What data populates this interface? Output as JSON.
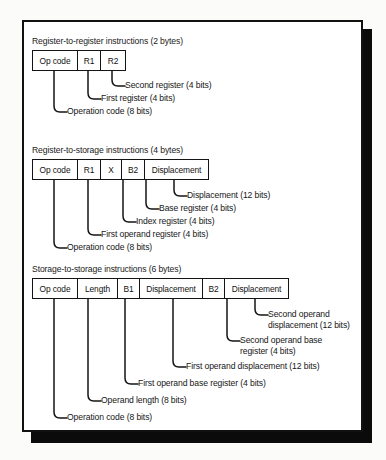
{
  "figure": {
    "background_color": "#fbfbfa",
    "frame_color": "#111111",
    "page_color": "#ffffff"
  },
  "diagrams": [
    {
      "id": "register-to-register",
      "title": "Register-to-register instructions (2 bytes)",
      "fields": [
        {
          "label": "Op code",
          "width_px": 45
        },
        {
          "label": "R1",
          "width_px": 23
        },
        {
          "label": "R2",
          "width_px": 24
        }
      ],
      "callouts": [
        {
          "label": "Second register (4 bits)"
        },
        {
          "label": "First register (4 bits)"
        },
        {
          "label": "Operation code (8 bits)"
        }
      ]
    },
    {
      "id": "register-to-storage",
      "title": "Register-to-storage instructions (4 bytes)",
      "fields": [
        {
          "label": "Op code",
          "width_px": 45
        },
        {
          "label": "R1",
          "width_px": 23
        },
        {
          "label": "X",
          "width_px": 21
        },
        {
          "label": "B2",
          "width_px": 23
        },
        {
          "label": "Displacement",
          "width_px": 63
        }
      ],
      "callouts": [
        {
          "label": "Displacement (12 bits)"
        },
        {
          "label": "Base register (4 bits)"
        },
        {
          "label": "Index register (4 bits)"
        },
        {
          "label": "First operand register (4 bits)"
        },
        {
          "label": "Operation code (8 bits)"
        }
      ]
    },
    {
      "id": "storage-to-storage",
      "title": "Storage-to-storage instructions (6 bytes)",
      "fields": [
        {
          "label": "Op code",
          "width_px": 45
        },
        {
          "label": "Length",
          "width_px": 40
        },
        {
          "label": "B1",
          "width_px": 22
        },
        {
          "label": "Displacement",
          "width_px": 63
        },
        {
          "label": "B2",
          "width_px": 22
        },
        {
          "label": "Displacement",
          "width_px": 63
        }
      ],
      "callouts": [
        {
          "label": "Second operand displacement (12 bits)"
        },
        {
          "label": "Second operand base register (4 bits)"
        },
        {
          "label": "First operand displacement (12 bits)"
        },
        {
          "label": "First operand base register (4 bits)"
        },
        {
          "label": "Operand length (8 bits)"
        },
        {
          "label": "Operation code (8 bits)"
        }
      ]
    }
  ]
}
